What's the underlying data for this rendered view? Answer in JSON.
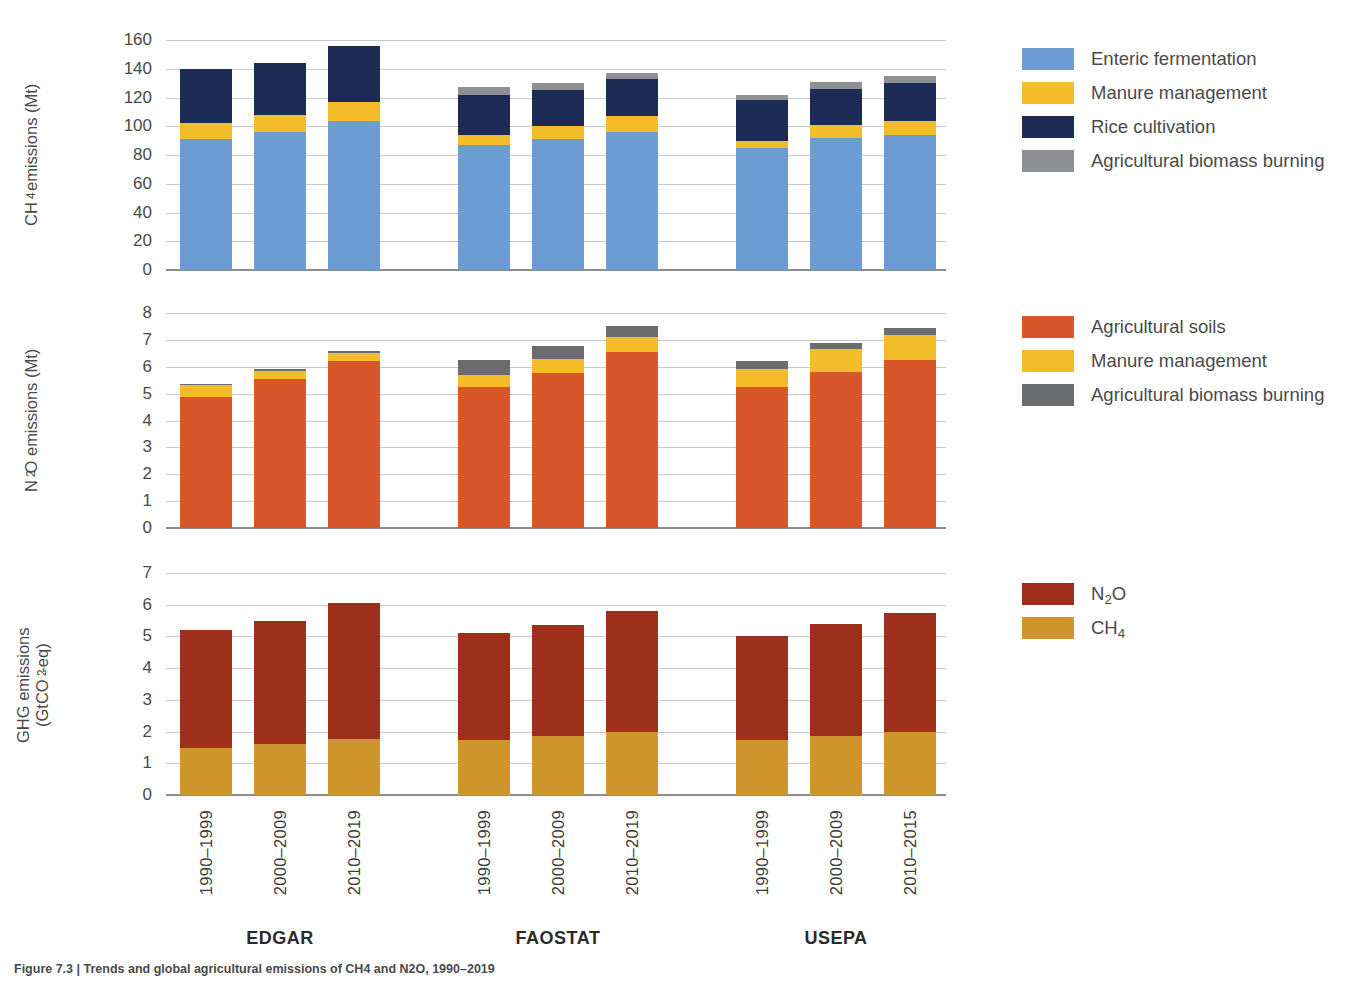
{
  "figure": {
    "caption": "Figure 7.3 | Trends and global agricultural emissions of CH4 and N2O, 1990–2019"
  },
  "panels": {
    "ch4": {
      "axis_title": "CH4 emissions (Mt)",
      "axis_title_main": "CH",
      "axis_title_sub": "4",
      "axis_title_rest": " emissions (Mt)",
      "yticks": [
        "0",
        "20",
        "40",
        "60",
        "80",
        "100",
        "120",
        "140",
        "160"
      ],
      "ylim": [
        0,
        160
      ]
    },
    "n2o": {
      "axis_title": "N2O emissions (Mt)",
      "axis_title_main": "N",
      "axis_title_sub": "2",
      "axis_title_rest": "O emissions (Mt)",
      "yticks": [
        "0",
        "1",
        "2",
        "3",
        "4",
        "5",
        "6",
        "7",
        "8"
      ],
      "ylim": [
        0,
        8
      ]
    },
    "ghg": {
      "axis_title": "GHG emissions (GtCO2-eq)",
      "axis_title_line1": "GHG emissions",
      "axis_title_line2_a": "(GtCO",
      "axis_title_line2_sub": "2",
      "axis_title_line2_b": "-eq)",
      "yticks": [
        "0",
        "1",
        "2",
        "3",
        "4",
        "5",
        "6",
        "7"
      ],
      "ylim": [
        0,
        7
      ]
    }
  },
  "xaxis": {
    "groups": [
      {
        "name": "EDGAR",
        "periods": [
          "1990–1999",
          "2000–2009",
          "2010–2019"
        ]
      },
      {
        "name": "FAOSTAT",
        "periods": [
          "1990–1999",
          "2000–2009",
          "2010–2019"
        ]
      },
      {
        "name": "USEPA",
        "periods": [
          "1990–1999",
          "2000–2009",
          "2010–2015"
        ]
      }
    ]
  },
  "legends": {
    "ch4": [
      {
        "label": "Enteric fermentation",
        "color": "#6d9cd2"
      },
      {
        "label": "Manure management",
        "color": "#f5bc2a"
      },
      {
        "label": "Rice cultivation",
        "color": "#1d2c54"
      },
      {
        "label": "Agricultural biomass burning",
        "color": "#8f9093"
      }
    ],
    "n2o": [
      {
        "label": "Agricultural soils",
        "color": "#d9552a"
      },
      {
        "label": "Manure management",
        "color": "#f5bc2a"
      },
      {
        "label": "Agricultural biomass burning",
        "color": "#6b6c6e"
      }
    ],
    "ghg": [
      {
        "label": "N2O",
        "html": "N<sub>2</sub>O",
        "color": "#9e2f1b"
      },
      {
        "label": "CH4",
        "html": "CH<sub>4</sub>",
        "color": "#cf962d"
      }
    ]
  },
  "colors": {
    "enteric_fermentation": "#6d9cd2",
    "manure_management_ch4": "#f5bc2a",
    "rice_cultivation": "#1d2c54",
    "biomass_burning_ch4": "#8f9093",
    "agricultural_soils": "#d9552a",
    "manure_management_n2o": "#f5bc2a",
    "biomass_burning_n2o": "#6b6c6e",
    "n2o_total": "#9e2f1b",
    "ch4_total": "#cf962d",
    "gridline": "#c9c9c9",
    "baseline": "#8d8d8d",
    "text": "#4a4a4a"
  },
  "chart_data": [
    {
      "type": "bar",
      "title": "CH4 emissions (Mt)",
      "stacked": true,
      "xlabel": "",
      "ylabel": "CH4 emissions (Mt)",
      "ylim": [
        0,
        160
      ],
      "ytick_step": 20,
      "grid": true,
      "categories": [
        "EDGAR 1990–1999",
        "EDGAR 2000–2009",
        "EDGAR 2010–2019",
        "FAOSTAT 1990–1999",
        "FAOSTAT 2000–2009",
        "FAOSTAT 2010–2019",
        "USEPA 1990–1999",
        "USEPA 2000–2009",
        "USEPA 2010–2015"
      ],
      "series": [
        {
          "name": "Enteric fermentation",
          "color": "#6d9cd2",
          "values": [
            91,
            96,
            104,
            87,
            91,
            96,
            85,
            92,
            94
          ]
        },
        {
          "name": "Manure management",
          "color": "#f5bc2a",
          "values": [
            11,
            12,
            13,
            7,
            9,
            11,
            5,
            9,
            10
          ]
        },
        {
          "name": "Rice cultivation",
          "color": "#1d2c54",
          "values": [
            38,
            36,
            39,
            28,
            25,
            26,
            28,
            25,
            26
          ]
        },
        {
          "name": "Agricultural biomass burning",
          "color": "#8f9093",
          "values": [
            0,
            0,
            0,
            5,
            5,
            4,
            4,
            5,
            5
          ]
        }
      ],
      "totals": [
        140,
        144,
        156,
        127,
        130,
        137,
        122,
        131,
        135
      ]
    },
    {
      "type": "bar",
      "title": "N2O emissions (Mt)",
      "stacked": true,
      "xlabel": "",
      "ylabel": "N2O emissions (Mt)",
      "ylim": [
        0,
        8
      ],
      "ytick_step": 1,
      "grid": true,
      "categories": [
        "EDGAR 1990–1999",
        "EDGAR 2000–2009",
        "EDGAR 2010–2019",
        "FAOSTAT 1990–1999",
        "FAOSTAT 2000–2009",
        "FAOSTAT 2010–2019",
        "USEPA 1990–1999",
        "USEPA 2000–2009",
        "USEPA 2010–2015"
      ],
      "series": [
        {
          "name": "Agricultural soils",
          "color": "#d9552a",
          "values": [
            4.87,
            5.55,
            6.2,
            5.25,
            5.78,
            6.55,
            5.25,
            5.8,
            6.25
          ]
        },
        {
          "name": "Manure management",
          "color": "#f5bc2a",
          "values": [
            0.45,
            0.3,
            0.33,
            0.45,
            0.5,
            0.55,
            0.65,
            0.85,
            0.95
          ]
        },
        {
          "name": "Agricultural biomass burning",
          "color": "#6b6c6e",
          "values": [
            0.05,
            0.07,
            0.07,
            0.55,
            0.5,
            0.4,
            0.3,
            0.25,
            0.25
          ]
        }
      ],
      "totals": [
        5.37,
        5.92,
        6.6,
        6.25,
        6.78,
        7.5,
        6.2,
        6.9,
        7.45
      ]
    },
    {
      "type": "bar",
      "title": "GHG emissions (GtCO2-eq)",
      "stacked": true,
      "xlabel": "",
      "ylabel": "GHG emissions (GtCO2-eq)",
      "ylim": [
        0,
        7
      ],
      "ytick_step": 1,
      "grid": true,
      "categories": [
        "EDGAR 1990–1999",
        "EDGAR 2000–2009",
        "EDGAR 2010–2019",
        "FAOSTAT 1990–1999",
        "FAOSTAT 2000–2009",
        "FAOSTAT 2010–2019",
        "USEPA 1990–1999",
        "USEPA 2000–2009",
        "USEPA 2010–2015"
      ],
      "series": [
        {
          "name": "CH4",
          "color": "#cf962d",
          "values": [
            1.48,
            1.62,
            1.78,
            1.75,
            1.85,
            2.0,
            1.75,
            1.85,
            1.98
          ]
        },
        {
          "name": "N2O",
          "color": "#9e2f1b",
          "values": [
            3.72,
            3.86,
            4.27,
            3.35,
            3.5,
            3.8,
            3.25,
            3.55,
            3.77
          ]
        }
      ],
      "totals": [
        5.2,
        5.48,
        6.05,
        5.1,
        5.35,
        5.8,
        5.0,
        5.4,
        5.75
      ]
    }
  ]
}
